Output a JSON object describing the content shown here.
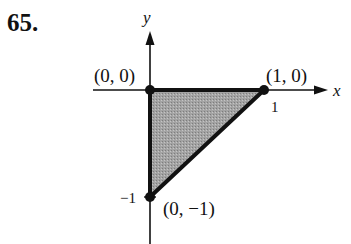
{
  "problem_number": "65.",
  "axes": {
    "x_label": "x",
    "y_label": "y"
  },
  "ticks": {
    "x_tick": "1",
    "y_tick": "−1"
  },
  "vertices": [
    {
      "label": "(0, 0)",
      "x": 0,
      "y": 0
    },
    {
      "label": "(1, 0)",
      "x": 1,
      "y": 0
    },
    {
      "label": "(0, −1)",
      "x": 0,
      "y": -1
    }
  ],
  "region": {
    "shape": "triangle",
    "fill_color": "#9a9a9a",
    "edge_color": "#111111"
  }
}
